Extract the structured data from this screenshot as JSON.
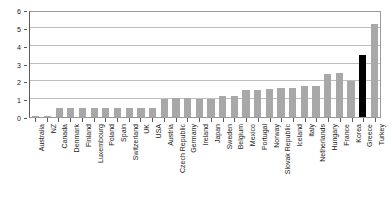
{
  "chart_data": {
    "type": "bar",
    "title": "",
    "xlabel": "",
    "ylabel": "",
    "ylim": [
      0,
      6
    ],
    "yticks": [
      0,
      1,
      2,
      3,
      4,
      5,
      6
    ],
    "grid": true,
    "legend": "none",
    "highlight_color": "#000000",
    "bar_color": "#a8a8a8",
    "highlighted_category": "Greece",
    "categories": [
      "Australia",
      "NZ",
      "Canada",
      "Denmark",
      "Finland",
      "Luxembourg",
      "Poland",
      "Spain",
      "Switzerland",
      "UK",
      "USA",
      "Austria",
      "Czech Republic",
      "Germany",
      "Ireland",
      "Japan",
      "Sweden",
      "Belgium",
      "Mexico",
      "Portugal",
      "Norway",
      "Slovak Republic",
      "Iceland",
      "Italy",
      "Netherlands",
      "Hungary",
      "France",
      "Korea",
      "Greece",
      "Turkey"
    ],
    "values": [
      0.06,
      0.06,
      0.5,
      0.5,
      0.5,
      0.5,
      0.5,
      0.5,
      0.5,
      0.5,
      0.5,
      1.0,
      1.05,
      1.05,
      1.0,
      1.0,
      1.2,
      1.2,
      1.5,
      1.5,
      1.55,
      1.6,
      1.6,
      1.75,
      1.75,
      2.4,
      2.45,
      2.0,
      3.5,
      5.2
    ]
  }
}
